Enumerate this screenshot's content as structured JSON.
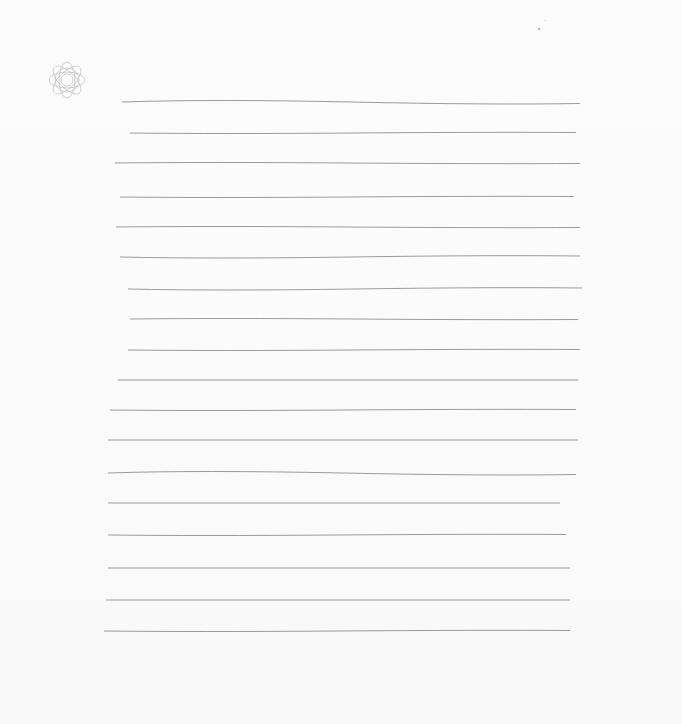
{
  "page": {
    "type": "blank lined paper",
    "background_color": "#fbfbfb",
    "line_color": "#7a7a7a",
    "ornament": "rosette-icon",
    "line_count": 18
  },
  "lines": [
    {
      "y": 102,
      "x1": 122,
      "x2": 580,
      "bend": -3
    },
    {
      "y": 133,
      "x1": 130,
      "x2": 576,
      "bend": 1
    },
    {
      "y": 163,
      "x1": 115,
      "x2": 580,
      "bend": -1
    },
    {
      "y": 197,
      "x1": 120,
      "x2": 574,
      "bend": 1
    },
    {
      "y": 227,
      "x1": 116,
      "x2": 580,
      "bend": -1
    },
    {
      "y": 257,
      "x1": 120,
      "x2": 580,
      "bend": 2
    },
    {
      "y": 289,
      "x1": 128,
      "x2": 582,
      "bend": 2
    },
    {
      "y": 319,
      "x1": 130,
      "x2": 578,
      "bend": -1
    },
    {
      "y": 350,
      "x1": 128,
      "x2": 580,
      "bend": 1
    },
    {
      "y": 380,
      "x1": 118,
      "x2": 578,
      "bend": 0
    },
    {
      "y": 410,
      "x1": 110,
      "x2": 576,
      "bend": 1
    },
    {
      "y": 440,
      "x1": 108,
      "x2": 578,
      "bend": 0
    },
    {
      "y": 473,
      "x1": 108,
      "x2": 576,
      "bend": -3
    },
    {
      "y": 503,
      "x1": 108,
      "x2": 560,
      "bend": 0
    },
    {
      "y": 535,
      "x1": 108,
      "x2": 566,
      "bend": 1
    },
    {
      "y": 568,
      "x1": 108,
      "x2": 570,
      "bend": 0
    },
    {
      "y": 600,
      "x1": 106,
      "x2": 570,
      "bend": 0
    },
    {
      "y": 631,
      "x1": 104,
      "x2": 570,
      "bend": 1
    }
  ]
}
